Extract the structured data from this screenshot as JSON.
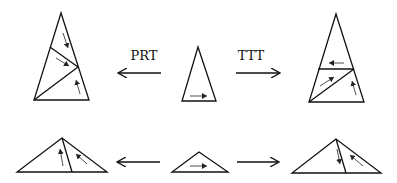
{
  "diagram": {
    "labels": {
      "left_operation": "PRT",
      "right_operation": "TTT"
    },
    "top_row": {
      "center": "tall isosceles triangle with rightward arrow along base",
      "left": "PRT decomposition: tall triangle split into three pieces with arrows",
      "right": "TTT decomposition: tall triangle split into three pieces with arrows"
    },
    "bottom_row": {
      "center": "flat obtuse triangle with rightward arrow along base",
      "left": "flat triangle split into two pieces with upward arrows",
      "right": "flat triangle split into two pieces with arrows"
    },
    "colors": {
      "stroke": "#111111",
      "background": "#ffffff"
    }
  }
}
